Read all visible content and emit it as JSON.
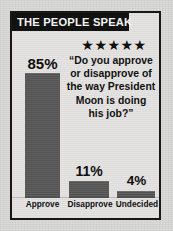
{
  "graphic": {
    "banner_title": "THE PEOPLE SPEAK",
    "stars": "★★★★★",
    "star_count": 5,
    "question_lines": [
      "“Do you approve",
      "or disapprove of",
      "the way President",
      "Moon is doing",
      "his job?”"
    ],
    "colors": {
      "banner_background": "#121212",
      "banner_text": "#f4f4f2",
      "bar_fill": "#575757",
      "frame_border": "#181818",
      "paper_background": "#d9d9d7",
      "text": "#111111"
    }
  },
  "chart_data": {
    "type": "bar",
    "title": "THE PEOPLE SPEAK",
    "subtitle": "“Do you approve or disapprove of the way President Moon is doing his job?”",
    "categories": [
      "Approve",
      "Disapprove",
      "Undecided"
    ],
    "values": [
      85,
      11,
      4
    ],
    "value_labels": [
      "85%",
      "11%",
      "4%"
    ],
    "unit": "%",
    "xlabel": "",
    "ylabel": "",
    "ylim": [
      0,
      100
    ],
    "grid": false,
    "legend": false
  }
}
